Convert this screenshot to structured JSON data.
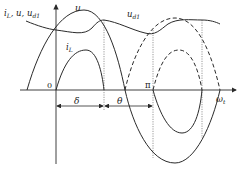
{
  "figure": {
    "y_axis_label": "i",
    "y_axis_label_sub": "L",
    "y_axis_label_rest": ", u, u",
    "y_axis_label_rest_sub": "d1",
    "x_axis_label": "ω",
    "x_axis_label_sub": "t",
    "origin_label": "0",
    "pi_label": "π",
    "curve_u_label": "u",
    "curve_ud1_label": "u",
    "curve_ud1_label_sub": "d1",
    "curve_iL_label": "i",
    "curve_iL_label_sub": "L",
    "delta_label": "δ",
    "theta_label": "θ"
  },
  "colors": {
    "stroke": "#2a2a2a",
    "dotted": "#555555",
    "background": "#ffffff"
  }
}
